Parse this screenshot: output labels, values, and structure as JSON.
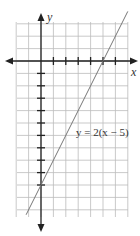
{
  "chart_data": {
    "type": "line",
    "title": "",
    "xlabel": "x",
    "ylabel": "y",
    "annotation": "y = 2(x − 5)",
    "equation": "y = 2(x - 5)",
    "xlim": [
      -2,
      7
    ],
    "ylim": [
      -13,
      3
    ],
    "grid": true,
    "tick_spacing": 1,
    "series": [
      {
        "name": "y = 2(x − 5)",
        "x": [
          -1.2,
          7.0
        ],
        "y": [
          -12.4,
          4.0
        ],
        "intercepts": {
          "x_intercept": 5,
          "y_intercept": -10
        },
        "slope": 2
      }
    ]
  },
  "labels": {
    "x_axis": "x",
    "y_axis": "y",
    "equation": "y = 2(x − 5)"
  },
  "colors": {
    "grid": "#bbbbbb",
    "axis": "#222222",
    "line": "#777777"
  }
}
